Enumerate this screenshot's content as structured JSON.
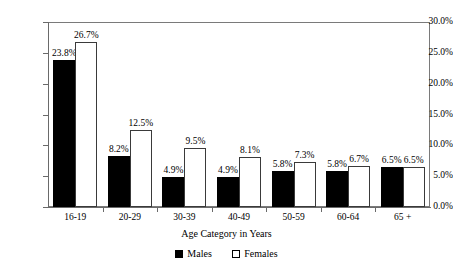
{
  "chart_data": {
    "type": "bar",
    "title": "",
    "subtitle": "",
    "xlabel": "Age Category in Years",
    "ylabel": "",
    "categories": [
      "16-19",
      "20-29",
      "30-39",
      "40-49",
      "50-59",
      "60-64",
      "65 +"
    ],
    "series": [
      {
        "name": "Males",
        "color": "#000000",
        "values": [
          23.8,
          8.2,
          4.9,
          4.9,
          5.8,
          5.8,
          6.5
        ],
        "labels": [
          "23.8%",
          "8.2%",
          "4.9%",
          "4.9%",
          "5.8%",
          "5.8%",
          "6.5%"
        ]
      },
      {
        "name": "Females",
        "color": "#ffffff",
        "values": [
          26.7,
          12.5,
          9.5,
          8.1,
          7.3,
          6.7,
          6.5
        ],
        "labels": [
          "26.7%",
          "12.5%",
          "9.5%",
          "8.1%",
          "7.3%",
          "6.7%",
          "6.5%"
        ]
      }
    ],
    "ylim": [
      0,
      30
    ],
    "ytick_values": [
      0,
      5,
      10,
      15,
      20,
      25,
      30
    ],
    "ytick_labels": [
      "0.0%",
      "5.0%",
      "10.0%",
      "15.0%",
      "20.0%",
      "25.0%",
      "30.0%"
    ],
    "grid": false,
    "legend_position": "bottom-center",
    "legend": [
      "Males",
      "Females"
    ]
  },
  "legend": {
    "items": [
      {
        "label": "Males",
        "swatch": "filled-square-icon"
      },
      {
        "label": "Females",
        "swatch": "open-square-icon"
      }
    ]
  }
}
